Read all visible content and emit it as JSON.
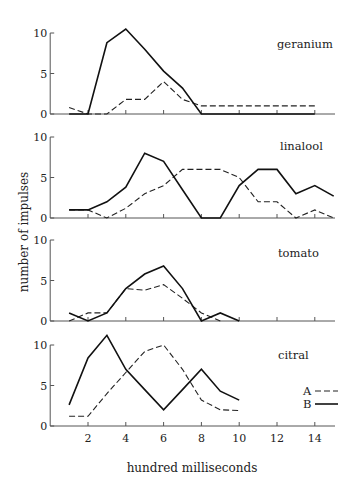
{
  "chart_data": {
    "type": "line",
    "layout": "4 vertically stacked panels sharing x-axis",
    "xlabel": "hundred milliseconds",
    "ylabel": "number of impulses",
    "xlim": [
      0,
      15
    ],
    "x_ticks": [
      2,
      4,
      6,
      8,
      10,
      12,
      14
    ],
    "y_ticks": [
      0,
      5,
      10
    ],
    "ylim": [
      0,
      10
    ],
    "grid": false,
    "legend": {
      "position": "lower right (citral panel)",
      "entries": [
        {
          "label": "A",
          "style": "dashed"
        },
        {
          "label": "B",
          "style": "solid"
        }
      ]
    },
    "panels": [
      {
        "title": "geranium",
        "series": [
          {
            "name": "A",
            "style": "dashed",
            "x": [
              1,
              2,
              3,
              4,
              5,
              6,
              7,
              8,
              9,
              10,
              11,
              12,
              13,
              14
            ],
            "values": [
              0.8,
              0,
              0,
              1.8,
              1.8,
              4,
              1.8,
              1,
              1,
              1,
              1,
              1,
              1,
              1
            ]
          },
          {
            "name": "B",
            "style": "solid",
            "x": [
              1,
              2,
              3,
              4,
              5,
              6,
              7,
              8,
              9,
              10,
              11,
              12,
              13,
              14
            ],
            "values": [
              0,
              0,
              8.8,
              10.5,
              8,
              5.3,
              3.2,
              0,
              0,
              0,
              0,
              0,
              0,
              0
            ]
          }
        ]
      },
      {
        "title": "linalool",
        "series": [
          {
            "name": "A",
            "style": "dashed",
            "x": [
              1,
              2,
              3,
              4,
              5,
              6,
              7,
              8,
              9,
              10,
              11,
              12,
              13,
              14,
              15
            ],
            "values": [
              1,
              1,
              0,
              1.2,
              3,
              4,
              6,
              6,
              6,
              5,
              2,
              2,
              0,
              1,
              0
            ]
          },
          {
            "name": "B",
            "style": "solid",
            "x": [
              1,
              2,
              3,
              4,
              5,
              6,
              7,
              8,
              9,
              10,
              11,
              12,
              13,
              14,
              15
            ],
            "values": [
              1,
              1,
              2,
              3.8,
              8,
              7,
              3.5,
              0,
              0,
              4,
              6,
              6,
              3,
              4,
              2.7
            ]
          }
        ]
      },
      {
        "title": "tomato",
        "series": [
          {
            "name": "A",
            "style": "dashed",
            "x": [
              1,
              2,
              3,
              4,
              5,
              6,
              7,
              8,
              9
            ],
            "values": [
              0,
              1,
              1,
              4,
              3.8,
              4.5,
              2.8,
              1,
              0
            ]
          },
          {
            "name": "B",
            "style": "solid",
            "x": [
              1,
              2,
              3,
              4,
              5,
              6,
              7,
              8,
              9,
              10
            ],
            "values": [
              1,
              0,
              1,
              4,
              5.8,
              6.8,
              4,
              0,
              1,
              0
            ]
          }
        ]
      },
      {
        "title": "citral",
        "series": [
          {
            "name": "A",
            "style": "dashed",
            "x": [
              1,
              2,
              3,
              4,
              5,
              6,
              7,
              8,
              9,
              10
            ],
            "values": [
              1.2,
              1.2,
              4,
              6.6,
              9.2,
              10,
              7,
              3.2,
              2,
              1.9
            ]
          },
          {
            "name": "B",
            "style": "solid",
            "x": [
              1,
              2,
              3,
              4,
              5,
              6,
              7,
              8,
              9,
              10
            ],
            "values": [
              2.6,
              8.4,
              11.2,
              7,
              4.5,
              2,
              4.5,
              7,
              4.3,
              3.2
            ]
          }
        ]
      }
    ]
  },
  "labels": {
    "panel_titles": [
      "geranium",
      "linalool",
      "tomato",
      "citral"
    ],
    "ytick_0": "0",
    "ytick_5": "5",
    "ytick_10": "10",
    "xticks": [
      "2",
      "4",
      "6",
      "8",
      "10",
      "12",
      "14"
    ],
    "xlabel": "hundred milliseconds",
    "ylabel": "number of impulses",
    "legend_a": "A",
    "legend_b": "B"
  }
}
